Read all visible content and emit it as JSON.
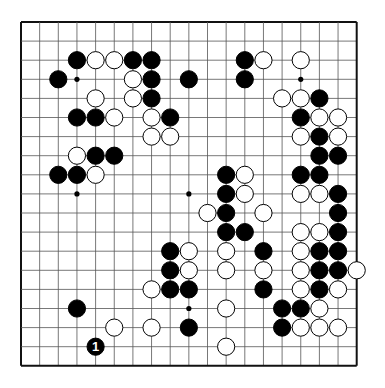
{
  "board": {
    "size": 19,
    "origin_x": 21,
    "origin_y": 22,
    "step_x": 18.65,
    "step_y": 19.1,
    "stone_radius": 8.6,
    "line_color": "#555555",
    "border_color": "#111111",
    "black_color": "#000000",
    "white_color": "#ffffff",
    "star_points": [
      [
        3,
        3
      ],
      [
        9,
        3
      ],
      [
        15,
        3
      ],
      [
        3,
        9
      ],
      [
        9,
        9
      ],
      [
        15,
        9
      ],
      [
        3,
        15
      ],
      [
        9,
        15
      ],
      [
        15,
        15
      ]
    ]
  },
  "stones": [
    {
      "c": 3,
      "r": 2,
      "color": "black"
    },
    {
      "c": 4,
      "r": 2,
      "color": "white"
    },
    {
      "c": 5,
      "r": 2,
      "color": "white"
    },
    {
      "c": 6,
      "r": 2,
      "color": "black"
    },
    {
      "c": 7,
      "r": 2,
      "color": "black"
    },
    {
      "c": 12,
      "r": 2,
      "color": "black"
    },
    {
      "c": 13,
      "r": 2,
      "color": "white"
    },
    {
      "c": 15,
      "r": 2,
      "color": "white"
    },
    {
      "c": 2,
      "r": 3,
      "color": "black"
    },
    {
      "c": 6,
      "r": 3,
      "color": "white"
    },
    {
      "c": 7,
      "r": 3,
      "color": "black"
    },
    {
      "c": 9,
      "r": 3,
      "color": "black"
    },
    {
      "c": 12,
      "r": 3,
      "color": "black"
    },
    {
      "c": 4,
      "r": 4,
      "color": "white"
    },
    {
      "c": 6,
      "r": 4,
      "color": "white"
    },
    {
      "c": 7,
      "r": 4,
      "color": "black"
    },
    {
      "c": 14,
      "r": 4,
      "color": "white"
    },
    {
      "c": 15,
      "r": 4,
      "color": "white"
    },
    {
      "c": 16,
      "r": 4,
      "color": "black"
    },
    {
      "c": 3,
      "r": 5,
      "color": "black"
    },
    {
      "c": 4,
      "r": 5,
      "color": "black"
    },
    {
      "c": 5,
      "r": 5,
      "color": "white"
    },
    {
      "c": 7,
      "r": 5,
      "color": "white"
    },
    {
      "c": 8,
      "r": 5,
      "color": "black"
    },
    {
      "c": 15,
      "r": 5,
      "color": "black"
    },
    {
      "c": 16,
      "r": 5,
      "color": "white"
    },
    {
      "c": 17,
      "r": 5,
      "color": "white"
    },
    {
      "c": 7,
      "r": 6,
      "color": "white"
    },
    {
      "c": 8,
      "r": 6,
      "color": "white"
    },
    {
      "c": 15,
      "r": 6,
      "color": "white"
    },
    {
      "c": 16,
      "r": 6,
      "color": "black"
    },
    {
      "c": 17,
      "r": 6,
      "color": "white"
    },
    {
      "c": 3,
      "r": 7,
      "color": "white"
    },
    {
      "c": 4,
      "r": 7,
      "color": "black"
    },
    {
      "c": 5,
      "r": 7,
      "color": "black"
    },
    {
      "c": 16,
      "r": 7,
      "color": "black"
    },
    {
      "c": 17,
      "r": 7,
      "color": "black"
    },
    {
      "c": 2,
      "r": 8,
      "color": "black"
    },
    {
      "c": 3,
      "r": 8,
      "color": "black"
    },
    {
      "c": 4,
      "r": 8,
      "color": "white"
    },
    {
      "c": 11,
      "r": 8,
      "color": "black"
    },
    {
      "c": 12,
      "r": 8,
      "color": "white"
    },
    {
      "c": 15,
      "r": 8,
      "color": "black"
    },
    {
      "c": 16,
      "r": 8,
      "color": "black"
    },
    {
      "c": 11,
      "r": 9,
      "color": "black"
    },
    {
      "c": 12,
      "r": 9,
      "color": "white"
    },
    {
      "c": 15,
      "r": 9,
      "color": "white"
    },
    {
      "c": 16,
      "r": 9,
      "color": "white"
    },
    {
      "c": 17,
      "r": 9,
      "color": "black"
    },
    {
      "c": 10,
      "r": 10,
      "color": "white"
    },
    {
      "c": 11,
      "r": 10,
      "color": "black"
    },
    {
      "c": 13,
      "r": 10,
      "color": "white"
    },
    {
      "c": 17,
      "r": 10,
      "color": "black"
    },
    {
      "c": 11,
      "r": 11,
      "color": "black"
    },
    {
      "c": 12,
      "r": 11,
      "color": "black"
    },
    {
      "c": 15,
      "r": 11,
      "color": "white"
    },
    {
      "c": 16,
      "r": 11,
      "color": "white"
    },
    {
      "c": 17,
      "r": 11,
      "color": "black"
    },
    {
      "c": 8,
      "r": 12,
      "color": "black"
    },
    {
      "c": 9,
      "r": 12,
      "color": "white"
    },
    {
      "c": 11,
      "r": 12,
      "color": "white"
    },
    {
      "c": 13,
      "r": 12,
      "color": "black"
    },
    {
      "c": 15,
      "r": 12,
      "color": "white"
    },
    {
      "c": 16,
      "r": 12,
      "color": "black"
    },
    {
      "c": 17,
      "r": 12,
      "color": "black"
    },
    {
      "c": 8,
      "r": 13,
      "color": "black"
    },
    {
      "c": 9,
      "r": 13,
      "color": "white"
    },
    {
      "c": 11,
      "r": 13,
      "color": "white"
    },
    {
      "c": 13,
      "r": 13,
      "color": "white"
    },
    {
      "c": 15,
      "r": 13,
      "color": "white"
    },
    {
      "c": 16,
      "r": 13,
      "color": "black"
    },
    {
      "c": 17,
      "r": 13,
      "color": "black"
    },
    {
      "c": 18,
      "r": 13,
      "color": "white"
    },
    {
      "c": 7,
      "r": 14,
      "color": "white"
    },
    {
      "c": 8,
      "r": 14,
      "color": "black"
    },
    {
      "c": 9,
      "r": 14,
      "color": "black"
    },
    {
      "c": 13,
      "r": 14,
      "color": "black"
    },
    {
      "c": 15,
      "r": 14,
      "color": "white"
    },
    {
      "c": 16,
      "r": 14,
      "color": "black"
    },
    {
      "c": 17,
      "r": 14,
      "color": "white"
    },
    {
      "c": 3,
      "r": 15,
      "color": "black"
    },
    {
      "c": 11,
      "r": 15,
      "color": "white"
    },
    {
      "c": 14,
      "r": 15,
      "color": "black"
    },
    {
      "c": 15,
      "r": 15,
      "color": "black"
    },
    {
      "c": 16,
      "r": 15,
      "color": "white"
    },
    {
      "c": 5,
      "r": 16,
      "color": "white"
    },
    {
      "c": 7,
      "r": 16,
      "color": "white"
    },
    {
      "c": 9,
      "r": 16,
      "color": "black"
    },
    {
      "c": 14,
      "r": 16,
      "color": "black"
    },
    {
      "c": 15,
      "r": 16,
      "color": "white"
    },
    {
      "c": 16,
      "r": 16,
      "color": "white"
    },
    {
      "c": 17,
      "r": 16,
      "color": "white"
    },
    {
      "c": 4,
      "r": 17,
      "color": "black",
      "label": "1"
    },
    {
      "c": 11,
      "r": 17,
      "color": "white"
    }
  ]
}
